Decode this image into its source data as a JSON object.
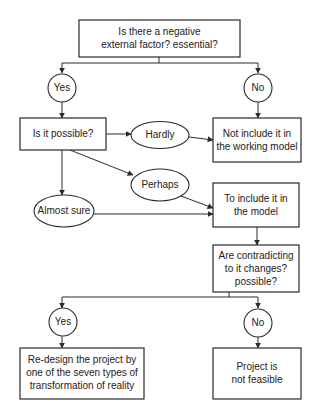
{
  "diagram": {
    "type": "flowchart",
    "nodes": {
      "q_external_factor": {
        "shape": "rect",
        "lines": [
          "Is there a negative",
          "external factor? essential?"
        ]
      },
      "yes_1": {
        "shape": "circle",
        "lines": [
          "Yes"
        ]
      },
      "no_1": {
        "shape": "circle",
        "lines": [
          "No"
        ]
      },
      "q_possible": {
        "shape": "rect",
        "lines": [
          "Is it possible?"
        ]
      },
      "hardly": {
        "shape": "ellipse",
        "lines": [
          "Hardly"
        ]
      },
      "not_include": {
        "shape": "rect",
        "lines": [
          "Not include it in",
          "the working model"
        ]
      },
      "perhaps": {
        "shape": "ellipse",
        "lines": [
          "Perhaps"
        ]
      },
      "almost_sure": {
        "shape": "ellipse",
        "lines": [
          "Almost sure"
        ]
      },
      "include": {
        "shape": "rect",
        "lines": [
          "To include it in",
          "the model"
        ]
      },
      "q_contradicting": {
        "shape": "rect",
        "lines": [
          "Are contradicting",
          "to it changes?",
          "possible?"
        ]
      },
      "yes_2": {
        "shape": "circle",
        "lines": [
          "Yes"
        ]
      },
      "no_2": {
        "shape": "circle",
        "lines": [
          "No"
        ]
      },
      "redesign": {
        "shape": "rect",
        "lines": [
          "Re-design the project by",
          "one of the seven types of",
          "transformation of reality"
        ]
      },
      "not_feasible": {
        "shape": "rect",
        "lines": [
          "Project is",
          "not feasible"
        ]
      }
    },
    "edges": [
      {
        "from": "q_external_factor",
        "to": "yes_1"
      },
      {
        "from": "q_external_factor",
        "to": "no_1"
      },
      {
        "from": "yes_1",
        "to": "q_possible"
      },
      {
        "from": "no_1",
        "to": "not_include"
      },
      {
        "from": "q_possible",
        "to": "hardly"
      },
      {
        "from": "hardly",
        "to": "not_include"
      },
      {
        "from": "q_possible",
        "to": "perhaps"
      },
      {
        "from": "q_possible",
        "to": "almost_sure"
      },
      {
        "from": "perhaps",
        "to": "include"
      },
      {
        "from": "almost_sure",
        "to": "include"
      },
      {
        "from": "include",
        "to": "q_contradicting"
      },
      {
        "from": "q_contradicting",
        "to": "yes_2"
      },
      {
        "from": "q_contradicting",
        "to": "no_2"
      },
      {
        "from": "yes_2",
        "to": "redesign"
      },
      {
        "from": "no_2",
        "to": "not_feasible"
      }
    ],
    "colors": {
      "stroke": "#2a2a2a",
      "text": "#222222",
      "background": "#ffffff"
    }
  }
}
